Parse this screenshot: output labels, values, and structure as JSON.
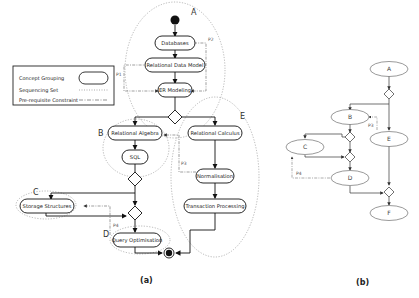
{
  "legend": {
    "items": [
      {
        "label": "Concept Grouping",
        "symbol": "rounded-oval"
      },
      {
        "label": "Sequencing Set",
        "symbol": "dotted-line"
      },
      {
        "label": "Pre-requisite Constraint",
        "symbol": "dash-dot-line"
      }
    ]
  },
  "diagram_a": {
    "caption": "(a)",
    "groups": [
      {
        "id": "A",
        "label": "A"
      },
      {
        "id": "B",
        "label": "B"
      },
      {
        "id": "C",
        "label": "C"
      },
      {
        "id": "D",
        "label": "D"
      },
      {
        "id": "E",
        "label": "E"
      }
    ],
    "nodes": [
      {
        "id": "databases",
        "label": "Databases",
        "group": "A"
      },
      {
        "id": "relational-data-model",
        "label": "Relational Data Model",
        "group": "A"
      },
      {
        "id": "er-modeling",
        "label": "ER Modeling",
        "group": "A"
      },
      {
        "id": "relational-algebra",
        "label": "Relational Algebra",
        "group": "B"
      },
      {
        "id": "sql",
        "label": "SQL",
        "group": "B"
      },
      {
        "id": "relational-calculus",
        "label": "Relational Calculus",
        "group": "E"
      },
      {
        "id": "normalisation",
        "label": "Normalisation",
        "group": "E"
      },
      {
        "id": "transaction-processing",
        "label": "Transaction Processing",
        "group": "E"
      },
      {
        "id": "storage-structures",
        "label": "Storage Structures",
        "group": "C"
      },
      {
        "id": "query-optimisation",
        "label": "Query Optimisation",
        "group": "D"
      }
    ],
    "constraints": [
      {
        "label": "P1"
      },
      {
        "label": "P2"
      },
      {
        "label": "P3"
      },
      {
        "label": "P4"
      }
    ]
  },
  "diagram_b": {
    "caption": "(b)",
    "nodes": [
      "A",
      "B",
      "C",
      "D",
      "E",
      "F"
    ],
    "constraints": [
      {
        "label": "P3"
      },
      {
        "label": "P4"
      }
    ]
  }
}
